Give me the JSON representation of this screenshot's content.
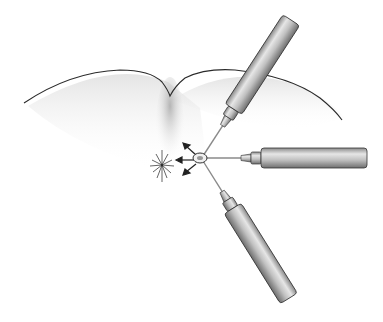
{
  "figure": {
    "colors": {
      "background": "#ffffff",
      "outline": "#2a2a2a",
      "barrel": "#b8b8b8",
      "barrel_highlight": "#e4e4e4",
      "barrel_shadow": "#7a7a7a",
      "needle": "#8a8a8a",
      "shading": "#9a9a9a"
    },
    "elements": {
      "skin_surface": "skin-contour",
      "syringes": [
        {
          "name": "upper-syringe",
          "angle": -55
        },
        {
          "name": "right-syringe",
          "angle": 0
        },
        {
          "name": "lower-syringe",
          "angle": 60
        }
      ],
      "target_node": "convergence-point",
      "arrows": [
        "arrow-up-left",
        "arrow-left",
        "arrow-down-left"
      ],
      "lesion": "radiating-lesion"
    }
  }
}
